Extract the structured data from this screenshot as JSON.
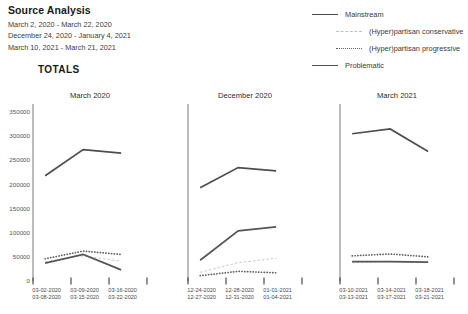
{
  "header": {
    "title": "Source Analysis",
    "date_ranges": [
      "March 2, 2020 - March 22, 2020",
      "December 24, 2020 - January 4, 2021",
      "March 10, 2021 - March 21, 2021"
    ]
  },
  "legend": {
    "items": [
      {
        "label": "Mainstream",
        "style": "solid",
        "color": "#4d4d4d",
        "indented": false
      },
      {
        "label": "(Hyper)partisan conservative",
        "style": "dashed",
        "color": "#c9c9c9",
        "indented": true
      },
      {
        "label": "(Hyper)partisan progressive",
        "style": "dotted",
        "color": "#606060",
        "indented": true
      },
      {
        "label": "Problematic",
        "style": "solid",
        "color": "#555555",
        "indented": false
      }
    ]
  },
  "section": {
    "totals_label": "TOTALS"
  },
  "chart_data": {
    "type": "line",
    "title": "TOTALS",
    "xlabel": "",
    "ylabel": "",
    "ylim": [
      0,
      350000
    ],
    "yticks": [
      0,
      50000,
      100000,
      150000,
      200000,
      250000,
      300000,
      350000
    ],
    "ytick_labels": [
      "0",
      "50000",
      "100000",
      "150000",
      "200000",
      "250000",
      "300000",
      "350000"
    ],
    "grid": false,
    "legend_position": "top-right",
    "panels": [
      {
        "title": "March 2020",
        "categories": [
          "03-02-2020\n03-08-2020",
          "03-09-2020\n03-15-2020",
          "03-16-2020\n03-22-2020"
        ],
        "tick_labels": [
          [
            "03-02-2020",
            "03-08-2020"
          ],
          [
            "03-09-2020",
            "03-15-2020"
          ],
          [
            "03-16-2020",
            "03-22-2020"
          ]
        ],
        "series": [
          {
            "name": "Mainstream",
            "values": [
              218000,
              272000,
              265000
            ]
          },
          {
            "name": "(Hyper)partisan conservative",
            "values": [
              40000,
              52000,
              41000
            ]
          },
          {
            "name": "(Hyper)partisan progressive",
            "values": [
              46000,
              62000,
              55000
            ]
          },
          {
            "name": "Problematic",
            "values": [
              37000,
              55000,
              23000
            ]
          }
        ]
      },
      {
        "title": "December 2020",
        "categories": [
          "12-24-2020\n12-27-2020",
          "12-28-2020\n12-31-2020",
          "01-01-2021\n01-04-2021"
        ],
        "tick_labels": [
          [
            "12-24-2020",
            "12-27-2020"
          ],
          [
            "12-28-2020",
            "12-31-2020"
          ],
          [
            "01-01-2021",
            "01-04-2021"
          ]
        ],
        "series": [
          {
            "name": "Mainstream",
            "values": [
              193000,
              235000,
              228000
            ]
          },
          {
            "name": "(Hyper)partisan conservative",
            "values": [
              18000,
              38000,
              47000
            ]
          },
          {
            "name": "(Hyper)partisan progressive",
            "values": [
              11000,
              20000,
              17000
            ]
          },
          {
            "name": "Problematic",
            "values": [
              43000,
              104000,
              112000
            ]
          }
        ]
      },
      {
        "title": "March 2021",
        "categories": [
          "03-10-2021\n03-13-2021",
          "03-14-2021\n03-17-2021",
          "03-18-2021\n03-21-2021"
        ],
        "tick_labels": [
          [
            "03-10-2021",
            "03-13-2021"
          ],
          [
            "03-14-2021",
            "03-17-2021"
          ],
          [
            "03-18-2021",
            "03-21-2021"
          ]
        ],
        "series": [
          {
            "name": "Mainstream",
            "values": [
              305000,
              315000,
              268000
            ]
          },
          {
            "name": "(Hyper)partisan conservative",
            "values": [
              38000,
              40000,
              38000
            ]
          },
          {
            "name": "(Hyper)partisan progressive",
            "values": [
              52000,
              56000,
              50000
            ]
          },
          {
            "name": "Problematic",
            "values": [
              40000,
              40000,
              39000
            ]
          }
        ]
      }
    ]
  }
}
